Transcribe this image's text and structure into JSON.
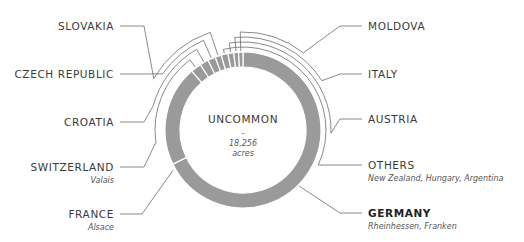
{
  "chart_data": {
    "type": "pie",
    "variant": "donut",
    "center_label": {
      "title": "UNCOMMON",
      "dash": "–",
      "value": "18,256",
      "unit": "acres"
    },
    "segment_color": "#9a9a9a",
    "segments": [
      {
        "name": "GERMANY",
        "sublabel": "Rheinhessen, Franken",
        "share": 67.8,
        "emphasis": true,
        "side": "right"
      },
      {
        "name": "FRANCE",
        "sublabel": "Alsace",
        "share": 20.8,
        "emphasis": false,
        "side": "left"
      },
      {
        "name": "SWITZERLAND",
        "sublabel": "Valais",
        "share": 2.2,
        "emphasis": false,
        "side": "left"
      },
      {
        "name": "CROATIA",
        "sublabel": "",
        "share": 1.8,
        "emphasis": false,
        "side": "left"
      },
      {
        "name": "CZECH REPUBLIC",
        "sublabel": "",
        "share": 1.6,
        "emphasis": false,
        "side": "left"
      },
      {
        "name": "SLOVAKIA",
        "sublabel": "",
        "share": 1.3,
        "emphasis": false,
        "side": "left"
      },
      {
        "name": "OTHERS",
        "sublabel": "New Zealand, Hungary, Argentina",
        "share": 1.4,
        "emphasis": false,
        "side": "right"
      },
      {
        "name": "AUSTRIA",
        "sublabel": "",
        "share": 1.2,
        "emphasis": false,
        "side": "right"
      },
      {
        "name": "ITALY",
        "sublabel": "",
        "share": 1.0,
        "emphasis": false,
        "side": "right"
      },
      {
        "name": "MOLDOVA",
        "sublabel": "",
        "share": 0.9,
        "emphasis": false,
        "side": "right"
      }
    ],
    "left_labels_top_to_bottom": [
      "SLOVAKIA",
      "CZECH REPUBLIC",
      "CROATIA",
      "SWITZERLAND",
      "FRANCE"
    ],
    "right_labels_top_to_bottom": [
      "MOLDOVA",
      "ITALY",
      "AUSTRIA",
      "OTHERS",
      "GERMANY"
    ]
  }
}
